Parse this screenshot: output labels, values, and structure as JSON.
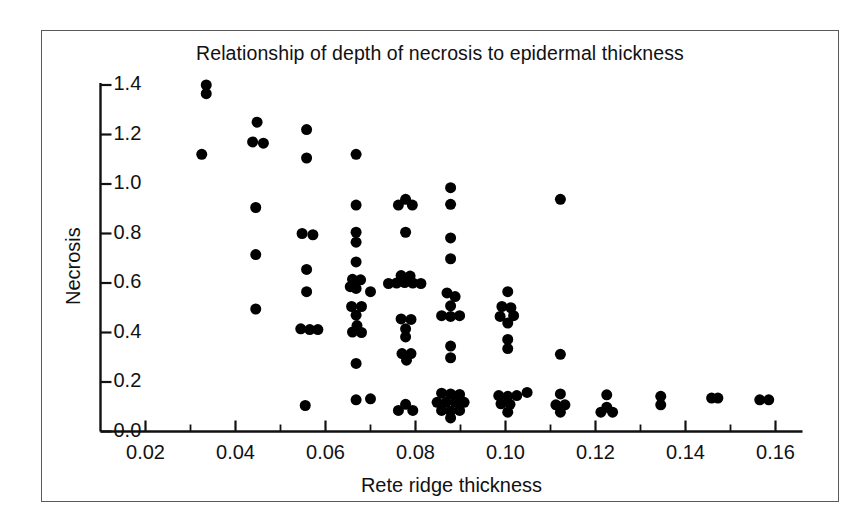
{
  "chart_data": {
    "type": "scatter",
    "title": "Relationship of depth of necrosis to epidermal thickness",
    "xlabel": "Rete ridge thickness",
    "ylabel": "Necrosis",
    "xlim": [
      0.012,
      0.166
    ],
    "ylim": [
      0.0,
      1.45
    ],
    "xticks": [
      0.02,
      0.04,
      0.06,
      0.08,
      0.1,
      0.12,
      0.14,
      0.16
    ],
    "xticklabels": [
      "0.02",
      "0.04",
      "0.06",
      "0.08",
      "0.10",
      "0.12",
      "0.14",
      "0.16"
    ],
    "xminorticks": [
      0.03,
      0.05,
      0.07,
      0.09,
      0.11,
      0.13,
      0.15
    ],
    "yticks": [
      0.0,
      0.2,
      0.4,
      0.6,
      0.8,
      1.0,
      1.2,
      1.4
    ],
    "yticklabels": [
      "0.0",
      "0.2",
      "0.4",
      "0.6",
      "0.8",
      "1.0",
      "1.2",
      "1.4"
    ],
    "grid": false,
    "legend": null,
    "marker": "filled-circle",
    "marker_color": "#000000",
    "marker_size": 11,
    "points": [
      [
        0.0335,
        1.4
      ],
      [
        0.0335,
        1.365
      ],
      [
        0.0325,
        1.12
      ],
      [
        0.0448,
        1.25
      ],
      [
        0.0438,
        1.17
      ],
      [
        0.0462,
        1.165
      ],
      [
        0.0445,
        0.905
      ],
      [
        0.0445,
        0.715
      ],
      [
        0.0445,
        0.495
      ],
      [
        0.0558,
        1.22
      ],
      [
        0.0558,
        1.105
      ],
      [
        0.0548,
        0.8
      ],
      [
        0.0572,
        0.795
      ],
      [
        0.0558,
        0.655
      ],
      [
        0.0558,
        0.565
      ],
      [
        0.0545,
        0.415
      ],
      [
        0.0565,
        0.412
      ],
      [
        0.0583,
        0.412
      ],
      [
        0.0555,
        0.105
      ],
      [
        0.0668,
        1.12
      ],
      [
        0.0668,
        0.915
      ],
      [
        0.0668,
        0.805
      ],
      [
        0.0668,
        0.765
      ],
      [
        0.0668,
        0.685
      ],
      [
        0.066,
        0.615
      ],
      [
        0.0678,
        0.613
      ],
      [
        0.0668,
        0.578
      ],
      [
        0.0655,
        0.585
      ],
      [
        0.07,
        0.565
      ],
      [
        0.0658,
        0.505
      ],
      [
        0.068,
        0.505
      ],
      [
        0.0668,
        0.47
      ],
      [
        0.066,
        0.402
      ],
      [
        0.068,
        0.4
      ],
      [
        0.067,
        0.428
      ],
      [
        0.0668,
        0.275
      ],
      [
        0.0668,
        0.128
      ],
      [
        0.07,
        0.132
      ],
      [
        0.0778,
        0.938
      ],
      [
        0.0762,
        0.915
      ],
      [
        0.0793,
        0.915
      ],
      [
        0.0778,
        0.805
      ],
      [
        0.074,
        0.598
      ],
      [
        0.0758,
        0.6
      ],
      [
        0.0776,
        0.602
      ],
      [
        0.0794,
        0.6
      ],
      [
        0.0812,
        0.598
      ],
      [
        0.0768,
        0.63
      ],
      [
        0.0788,
        0.628
      ],
      [
        0.0768,
        0.455
      ],
      [
        0.079,
        0.453
      ],
      [
        0.0778,
        0.415
      ],
      [
        0.0778,
        0.382
      ],
      [
        0.077,
        0.315
      ],
      [
        0.079,
        0.315
      ],
      [
        0.078,
        0.288
      ],
      [
        0.0778,
        0.11
      ],
      [
        0.0762,
        0.085
      ],
      [
        0.0794,
        0.085
      ],
      [
        0.0878,
        0.985
      ],
      [
        0.0878,
        0.918
      ],
      [
        0.0878,
        0.782
      ],
      [
        0.0878,
        0.698
      ],
      [
        0.087,
        0.56
      ],
      [
        0.0888,
        0.545
      ],
      [
        0.0878,
        0.508
      ],
      [
        0.0858,
        0.468
      ],
      [
        0.0878,
        0.465
      ],
      [
        0.0898,
        0.468
      ],
      [
        0.0878,
        0.345
      ],
      [
        0.0878,
        0.298
      ],
      [
        0.0858,
        0.155
      ],
      [
        0.0878,
        0.152
      ],
      [
        0.0898,
        0.15
      ],
      [
        0.0848,
        0.118
      ],
      [
        0.0868,
        0.118
      ],
      [
        0.0888,
        0.118
      ],
      [
        0.0908,
        0.118
      ],
      [
        0.0858,
        0.085
      ],
      [
        0.0878,
        0.082
      ],
      [
        0.0898,
        0.085
      ],
      [
        0.0878,
        0.055
      ],
      [
        0.1005,
        0.565
      ],
      [
        0.0992,
        0.505
      ],
      [
        0.1012,
        0.5
      ],
      [
        0.0988,
        0.465
      ],
      [
        0.1018,
        0.468
      ],
      [
        0.1005,
        0.438
      ],
      [
        0.1005,
        0.372
      ],
      [
        0.1005,
        0.335
      ],
      [
        0.0985,
        0.145
      ],
      [
        0.1005,
        0.142
      ],
      [
        0.1025,
        0.145
      ],
      [
        0.099,
        0.112
      ],
      [
        0.101,
        0.11
      ],
      [
        0.1005,
        0.078
      ],
      [
        0.1048,
        0.158
      ],
      [
        0.1122,
        0.938
      ],
      [
        0.1122,
        0.312
      ],
      [
        0.1122,
        0.152
      ],
      [
        0.1112,
        0.108
      ],
      [
        0.1132,
        0.108
      ],
      [
        0.1122,
        0.078
      ],
      [
        0.1225,
        0.148
      ],
      [
        0.1225,
        0.098
      ],
      [
        0.1212,
        0.078
      ],
      [
        0.1238,
        0.078
      ],
      [
        0.1345,
        0.142
      ],
      [
        0.1345,
        0.108
      ],
      [
        0.1458,
        0.135
      ],
      [
        0.1472,
        0.135
      ],
      [
        0.1565,
        0.128
      ],
      [
        0.1585,
        0.128
      ]
    ]
  }
}
